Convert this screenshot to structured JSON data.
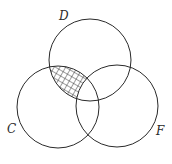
{
  "diagram": {
    "type": "venn",
    "sets": [
      {
        "label": "D",
        "cx": 90,
        "cy": 60,
        "r": 41,
        "label_x": 59,
        "label_y": 20
      },
      {
        "label": "C",
        "cx": 58,
        "cy": 107,
        "r": 41,
        "label_x": 7,
        "label_y": 133
      },
      {
        "label": "F",
        "cx": 117,
        "cy": 106,
        "r": 41,
        "label_x": 156,
        "label_y": 135
      }
    ],
    "shaded_region": "C ∩ D − F",
    "stroke_color": "#2a2a2a",
    "hatch_color": "#2a2a2a",
    "background": "#ffffff"
  }
}
